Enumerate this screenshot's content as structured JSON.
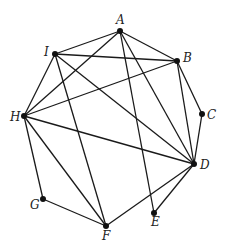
{
  "diagram": {
    "type": "graph",
    "nodes": [
      {
        "id": "A",
        "label": "A",
        "x": 120,
        "y": 31,
        "lx": 116,
        "ly": 24
      },
      {
        "id": "B",
        "label": "B",
        "x": 177,
        "y": 61,
        "lx": 183,
        "ly": 62
      },
      {
        "id": "C",
        "label": "C",
        "x": 202,
        "y": 114,
        "lx": 207,
        "ly": 119
      },
      {
        "id": "D",
        "label": "D",
        "x": 194,
        "y": 164,
        "lx": 200,
        "ly": 169
      },
      {
        "id": "E",
        "label": "E",
        "x": 154,
        "y": 213,
        "lx": 151,
        "ly": 226
      },
      {
        "id": "F",
        "label": "F",
        "x": 106,
        "y": 226,
        "lx": 102,
        "ly": 240
      },
      {
        "id": "G",
        "label": "G",
        "x": 43,
        "y": 199,
        "lx": 30,
        "ly": 209
      },
      {
        "id": "H",
        "label": "H",
        "x": 24,
        "y": 116,
        "lx": 10,
        "ly": 121
      },
      {
        "id": "I",
        "label": "I",
        "x": 55,
        "y": 54,
        "lx": 44,
        "ly": 56
      }
    ],
    "edges": [
      [
        "A",
        "I"
      ],
      [
        "A",
        "B"
      ],
      [
        "A",
        "H"
      ],
      [
        "A",
        "E"
      ],
      [
        "A",
        "D"
      ],
      [
        "I",
        "B"
      ],
      [
        "I",
        "H"
      ],
      [
        "I",
        "F"
      ],
      [
        "I",
        "D"
      ],
      [
        "B",
        "H"
      ],
      [
        "B",
        "C"
      ],
      [
        "B",
        "D"
      ],
      [
        "C",
        "D"
      ],
      [
        "H",
        "D"
      ],
      [
        "H",
        "G"
      ],
      [
        "H",
        "F"
      ],
      [
        "G",
        "F"
      ],
      [
        "F",
        "D"
      ],
      [
        "E",
        "D"
      ]
    ]
  }
}
